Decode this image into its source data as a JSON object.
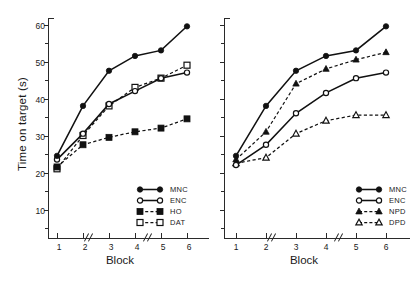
{
  "chart_data": {
    "type": "line",
    "title": "",
    "xlabel": "Block",
    "ylabel": "Time on target (s)",
    "x": [
      1,
      2,
      3,
      4,
      5,
      6
    ],
    "xticklabels": [
      "1",
      "2",
      "3",
      "4",
      "5",
      "6"
    ],
    "yticks": [
      10,
      20,
      30,
      40,
      50,
      60
    ],
    "yticklabels": [
      "10",
      "20",
      "30",
      "40",
      "50",
      "60"
    ],
    "ylim": [
      5,
      64
    ],
    "xlim": [
      0.5,
      6.5
    ],
    "grid": false,
    "axis_breaks": [
      "between block 2 and 3",
      "between block 4 and 5"
    ],
    "legend_position": "lower right inside axes",
    "panels": [
      {
        "panel": "left",
        "series": [
          {
            "name": "MNC",
            "marker": "filled-circle",
            "line": "solid",
            "values": [
              24.5,
              38,
              47.5,
              51.5,
              53,
              59.5
            ]
          },
          {
            "name": "ENC",
            "marker": "open-circle",
            "line": "solid",
            "values": [
              23.5,
              30.5,
              38.5,
              42,
              45.5,
              47
            ]
          },
          {
            "name": "HO",
            "marker": "filled-square",
            "line": "dashed",
            "values": [
              21.5,
              27.5,
              29.5,
              31,
              32,
              34.5
            ]
          },
          {
            "name": "DAT",
            "marker": "open-square",
            "line": "dashed",
            "values": [
              21,
              30,
              38,
              43,
              45.5,
              49
            ]
          }
        ]
      },
      {
        "panel": "right",
        "series": [
          {
            "name": "MNC",
            "marker": "filled-circle",
            "line": "solid",
            "values": [
              24.5,
              38,
              47.5,
              51.5,
              53,
              59.5
            ]
          },
          {
            "name": "ENC",
            "marker": "open-circle",
            "line": "solid",
            "values": [
              22,
              27.5,
              36,
              41.5,
              45.5,
              47
            ]
          },
          {
            "name": "NPD",
            "marker": "filled-triangle",
            "line": "dashed",
            "values": [
              23.5,
              31,
              44,
              48,
              50.5,
              52.5
            ]
          },
          {
            "name": "DPD",
            "marker": "open-triangle",
            "line": "dashed",
            "values": [
              22.5,
              24,
              30.5,
              34,
              35.5,
              35.5
            ]
          }
        ]
      }
    ]
  },
  "axes": {
    "ylabel": "Time on target (s)",
    "xlabel_left": "Block",
    "xlabel_right": "Block",
    "ytick_60": "60",
    "ytick_50": "50",
    "ytick_40": "40",
    "ytick_30": "30",
    "ytick_20": "20",
    "ytick_10": "10",
    "xtick_1": "1",
    "xtick_2": "2",
    "xtick_3": "3",
    "xtick_4": "4",
    "xtick_5": "5",
    "xtick_6": "6"
  },
  "legend_left": {
    "items": [
      {
        "label": "MNC"
      },
      {
        "label": "ENC"
      },
      {
        "label": "HO"
      },
      {
        "label": "DAT"
      }
    ]
  },
  "legend_right": {
    "items": [
      {
        "label": "MNC"
      },
      {
        "label": "ENC"
      },
      {
        "label": "NPD"
      },
      {
        "label": "DPD"
      }
    ]
  },
  "style": {
    "ink": "#1a1a1a",
    "axis": "#2a2a2a",
    "background": "#ffffff"
  }
}
